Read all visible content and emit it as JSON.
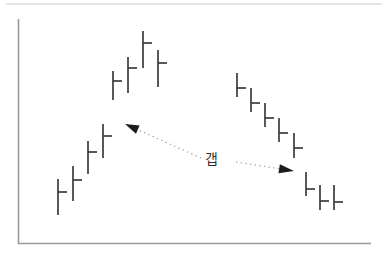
{
  "chart_data": {
    "type": "bar",
    "gap_label": "갭",
    "colors": {
      "bar": "#3c3c3c",
      "axis": "#9a9a9a",
      "arrow_head": "#1c1c1c",
      "arrow_shaft": "#9b9b9b",
      "label": "#2e2e2e",
      "top_edge": "#c9c9c9"
    },
    "axes": {
      "y_axis": {
        "x": 18.5,
        "top": 19
      },
      "x_axis": {
        "y": 243.5,
        "left": 18.5,
        "right": 371
      },
      "tick_labels": "none",
      "grid": "off"
    },
    "top_edge": {
      "y": 4,
      "left": 6,
      "right": 382
    },
    "tick_len": 9,
    "bar_groups": [
      {
        "name": "uptrend-before-gap",
        "bars": [
          {
            "x": 58,
            "top": 179,
            "bottom": 215,
            "tick_y": 192
          },
          {
            "x": 73,
            "top": 166,
            "bottom": 201,
            "tick_y": 180
          },
          {
            "x": 88,
            "top": 141,
            "bottom": 174,
            "tick_y": 152
          },
          {
            "x": 103,
            "top": 124,
            "bottom": 158,
            "tick_y": 136
          }
        ]
      },
      {
        "name": "uptrend-after-gap",
        "bars": [
          {
            "x": 113,
            "top": 71,
            "bottom": 100,
            "tick_y": 81
          },
          {
            "x": 128,
            "top": 57,
            "bottom": 93,
            "tick_y": 68
          },
          {
            "x": 143,
            "top": 31,
            "bottom": 68,
            "tick_y": 43
          },
          {
            "x": 158,
            "top": 50,
            "bottom": 87,
            "tick_y": 63
          }
        ]
      },
      {
        "name": "downtrend-before-gap",
        "bars": [
          {
            "x": 237,
            "top": 73,
            "bottom": 97,
            "tick_y": 88
          },
          {
            "x": 251,
            "top": 88,
            "bottom": 112,
            "tick_y": 103
          },
          {
            "x": 265,
            "top": 103,
            "bottom": 127,
            "tick_y": 118
          },
          {
            "x": 279,
            "top": 118,
            "bottom": 142,
            "tick_y": 133
          },
          {
            "x": 294,
            "top": 133,
            "bottom": 158,
            "tick_y": 148
          }
        ]
      },
      {
        "name": "downtrend-after-gap",
        "bars": [
          {
            "x": 306,
            "top": 172,
            "bottom": 196,
            "tick_y": 189
          },
          {
            "x": 320,
            "top": 185,
            "bottom": 210,
            "tick_y": 201
          },
          {
            "x": 334,
            "top": 185,
            "bottom": 210,
            "tick_y": 202
          }
        ]
      }
    ],
    "arrows": [
      {
        "name": "up-gap-arrow",
        "shaft_from": [
          201,
          158
        ],
        "tip": [
          125,
          124
        ],
        "head_len": 14,
        "head_w": 9
      },
      {
        "name": "down-gap-arrow",
        "shaft_from": [
          236,
          162
        ],
        "tip": [
          294,
          171
        ],
        "head_len": 15,
        "head_w": 9
      }
    ]
  }
}
